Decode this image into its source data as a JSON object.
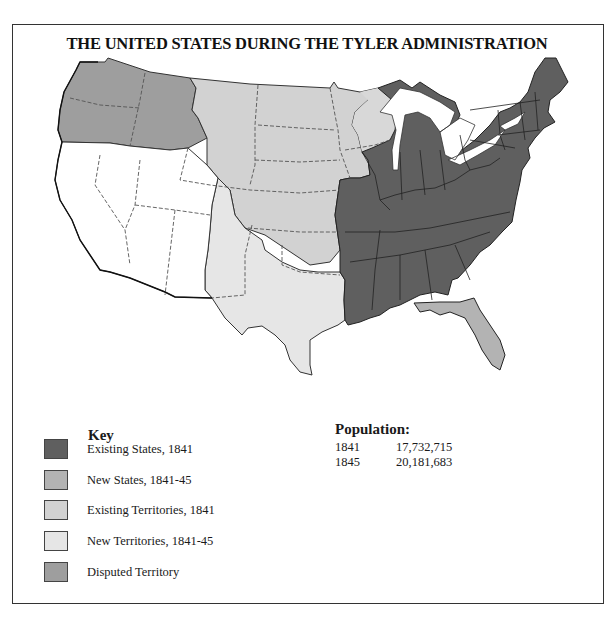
{
  "title": "THE UNITED STATES DURING THE TYLER ADMINISTRATION",
  "key": {
    "heading": "Key",
    "items": [
      {
        "label": "Existing States, 1841",
        "color": "#5f5f5f"
      },
      {
        "label": "New States, 1841-45",
        "color": "#b3b3b3"
      },
      {
        "label": "Existing Territories, 1841",
        "color": "#d2d2d2"
      },
      {
        "label": "New Territories, 1841-45",
        "color": "#e6e6e6"
      },
      {
        "label": "Disputed Territory",
        "color": "#9e9e9e"
      }
    ]
  },
  "population": {
    "heading": "Population:",
    "rows": [
      {
        "year": "1841",
        "value": "17,732,715"
      },
      {
        "year": "1845",
        "value": "20,181,683"
      }
    ]
  },
  "map": {
    "regions": [
      {
        "name": "existing-states",
        "color": "#5f5f5f"
      },
      {
        "name": "new-states-florida",
        "color": "#b3b3b3"
      },
      {
        "name": "existing-territories",
        "color": "#d2d2d2"
      },
      {
        "name": "new-territories",
        "color": "#e6e6e6"
      },
      {
        "name": "disputed-oregon",
        "color": "#9e9e9e"
      },
      {
        "name": "unorganized-southwest",
        "color": "#ffffff"
      }
    ]
  }
}
